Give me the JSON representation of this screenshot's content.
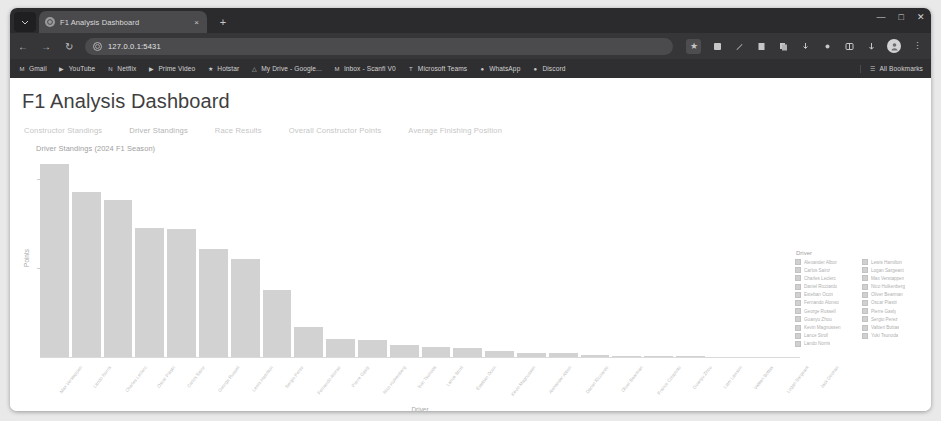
{
  "browser": {
    "tab": {
      "title": "F1 Analysis Dashboard",
      "close_label": "×",
      "favicon_name": "page-favicon"
    },
    "new_tab_label": "+",
    "window_controls": {
      "minimize": "—",
      "maximize": "□",
      "close": "✕"
    },
    "toolbar": {
      "back_label": "←",
      "forward_label": "→",
      "reload_label": "↻",
      "url": "127.0.0.1:5431",
      "site_info_label": "i",
      "bookmark_star_label": "★",
      "menu_label": "⋮",
      "profile_label": "●"
    },
    "bookmarks": [
      {
        "label": "Gmail",
        "icon": "M"
      },
      {
        "label": "YouTube",
        "icon": "▶"
      },
      {
        "label": "Netflix",
        "icon": "N"
      },
      {
        "label": "Prime Video",
        "icon": "▶"
      },
      {
        "label": "Hotstar",
        "icon": "★"
      },
      {
        "label": "My Drive - Google...",
        "icon": "△"
      },
      {
        "label": "Inbox - Scanfi V0",
        "icon": "M"
      },
      {
        "label": "Microsoft Teams",
        "icon": "T"
      },
      {
        "label": "WhatsApp",
        "icon": "●"
      },
      {
        "label": "Discord",
        "icon": "●"
      }
    ],
    "all_bookmarks_label": "All Bookmarks",
    "all_bookmarks_icon": "☰"
  },
  "page": {
    "title": "F1 Analysis Dashboard",
    "tabs": [
      {
        "label": "Constructor Standings",
        "active": false
      },
      {
        "label": "Driver Standings",
        "active": true
      },
      {
        "label": "Race Results",
        "active": false
      },
      {
        "label": "Overall Constructor Points",
        "active": false
      },
      {
        "label": "Average Finishing Position",
        "active": false
      }
    ]
  },
  "chart_data": {
    "type": "bar",
    "title": "Driver Standings (2024 F1 Season)",
    "xlabel": "Driver",
    "ylabel": "Points",
    "grid": false,
    "legend_position": "right",
    "legend_title": "Driver",
    "ylim": [
      0,
      450
    ],
    "yticks": [
      200,
      400
    ],
    "bar_color": "#d2d2d2",
    "categories": [
      "Max Verstappen",
      "Lando Norris",
      "Charles Leclerc",
      "Oscar Piastri",
      "Carlos Sainz",
      "George Russell",
      "Lewis Hamilton",
      "Sergio Perez",
      "Fernando Alonso",
      "Pierre Gasly",
      "Nico Hulkenberg",
      "Yuki Tsunoda",
      "Lance Stroll",
      "Esteban Ocon",
      "Kevin Magnussen",
      "Alexander Albon",
      "Daniel Ricciardo",
      "Oliver Bearman",
      "Franco Colapinto",
      "Guanyu Zhou",
      "Liam Lawson",
      "Valtteri Bottas",
      "Logan Sargeant",
      "Jack Doohan"
    ],
    "values": [
      437,
      374,
      356,
      292,
      290,
      245,
      223,
      152,
      70,
      42,
      41,
      30,
      24,
      23,
      16,
      12,
      12,
      7,
      5,
      4,
      4,
      0,
      0,
      0
    ],
    "legend_entries_left": [
      "Alexander Albon",
      "Carlos Sainz",
      "Charles Leclerc",
      "Daniel Ricciardo",
      "Esteban Ocon",
      "Fernando Alonso",
      "George Russell",
      "Guanyu Zhou",
      "Kevin Magnussen",
      "Lance Stroll",
      "Lando Norris"
    ],
    "legend_entries_right": [
      "Lewis Hamilton",
      "Logan Sargeant",
      "Max Verstappen",
      "Nico Hulkenberg",
      "Oliver Bearman",
      "Oscar Piastri",
      "Pierre Gasly",
      "Sergio Perez",
      "Valtteri Bottas",
      "Yuki Tsunoda"
    ]
  }
}
